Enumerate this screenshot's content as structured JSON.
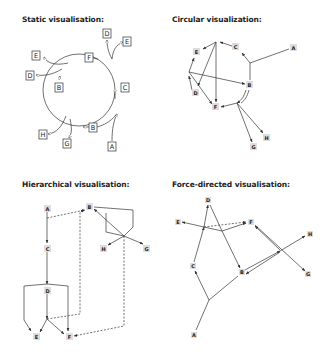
{
  "panels": {
    "static": {
      "title": "Static visualisation:",
      "nodes": [
        "D",
        "E",
        "E",
        "F",
        "D",
        "B",
        "C",
        "H",
        "B",
        "G",
        "A"
      ]
    },
    "circular": {
      "title": "Circular visualization:",
      "nodes": [
        "A",
        "C",
        "E",
        "D",
        "B",
        "F",
        "G",
        "H"
      ]
    },
    "hierarchical": {
      "title": "Hierarchical visualisation:",
      "nodes": [
        "A",
        "B",
        "H",
        "G",
        "C",
        "D",
        "E",
        "F"
      ]
    },
    "force": {
      "title": "Force-directed visualisation:",
      "nodes": [
        "D",
        "E",
        "F",
        "H",
        "C",
        "B",
        "G",
        "A"
      ]
    }
  },
  "colors": {
    "edge": "#333333",
    "node_fill_grey": "#dddddd",
    "node_stroke": "#333333"
  }
}
